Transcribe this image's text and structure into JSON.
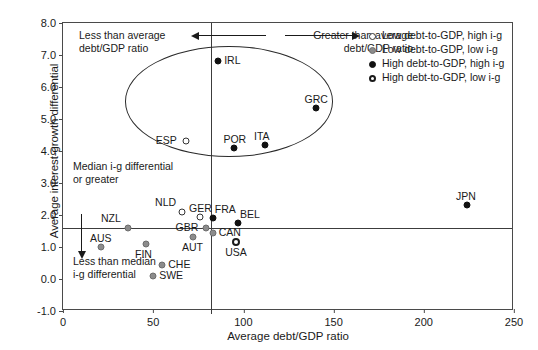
{
  "chart_data": {
    "type": "scatter",
    "title": "",
    "xlabel": "Average debt/GDP ratio",
    "ylabel": "Average interest-growth differential",
    "xlim": [
      0,
      250
    ],
    "ylim": [
      -1.0,
      8.0
    ],
    "xticks": [
      0,
      50,
      100,
      150,
      200,
      250
    ],
    "yticks": [
      -1.0,
      0.0,
      1.0,
      2.0,
      3.0,
      4.0,
      5.0,
      6.0,
      7.0,
      8.0
    ],
    "xtick_labels": [
      "0",
      "50",
      "100",
      "150",
      "200",
      "250"
    ],
    "ytick_labels": [
      "-1.0",
      "0.0",
      "1.0",
      "2.0",
      "3.0",
      "4.0",
      "5.0",
      "6.0",
      "7.0",
      "8.0"
    ],
    "grid": false,
    "legend_position": "top-right",
    "reference_lines": {
      "vertical_x": 82,
      "horizontal_y": 1.6
    },
    "ellipse": {
      "center_x": 92,
      "center_y": 5.55,
      "width_x": 115,
      "height_y": 3.45
    },
    "series": [
      {
        "name": "Low debt-to-GDP, high i-g",
        "marker": "open-circle",
        "color": "#ffffff",
        "edge_color": "#333333",
        "points": [
          {
            "label": "ESP",
            "x": 68,
            "y": 4.3,
            "label_pos": "left"
          },
          {
            "label": "NLD",
            "x": 66,
            "y": 2.1,
            "label_pos": "above-left"
          },
          {
            "label": "GER",
            "x": 76,
            "y": 1.95,
            "label_pos": "above"
          }
        ]
      },
      {
        "name": "Low debt-to-GDP, low i-g",
        "marker": "filled-gray-circle",
        "color": "#8c8c8c",
        "edge_color": "#6d6d6d",
        "points": [
          {
            "label": "NZL",
            "x": 36,
            "y": 1.6,
            "label_pos": "above-left"
          },
          {
            "label": "AUS",
            "x": 21,
            "y": 1.0,
            "label_pos": "above"
          },
          {
            "label": "FIN",
            "x": 46,
            "y": 1.1,
            "label_pos": "below"
          },
          {
            "label": "CHE",
            "x": 55,
            "y": 0.45,
            "label_pos": "right"
          },
          {
            "label": "SWE",
            "x": 50,
            "y": 0.1,
            "label_pos": "right"
          },
          {
            "label": "GBR",
            "x": 79,
            "y": 1.6,
            "label_pos": "left"
          },
          {
            "label": "AUT",
            "x": 72,
            "y": 1.3,
            "label_pos": "below"
          },
          {
            "label": "CAN",
            "x": 83,
            "y": 1.45,
            "label_pos": "right"
          }
        ]
      },
      {
        "name": "High debt-to-GDP, high i-g",
        "marker": "filled-black-circle",
        "color": "#111111",
        "edge_color": "#111111",
        "points": [
          {
            "label": "IRL",
            "x": 86,
            "y": 6.8,
            "label_pos": "right"
          },
          {
            "label": "GRC",
            "x": 140,
            "y": 5.35,
            "label_pos": "above"
          },
          {
            "label": "POR",
            "x": 95,
            "y": 4.1,
            "label_pos": "above"
          },
          {
            "label": "ITA",
            "x": 112,
            "y": 4.2,
            "label_pos": "above"
          },
          {
            "label": "FRA",
            "x": 83,
            "y": 1.9,
            "label_pos": "above-right"
          },
          {
            "label": "BEL",
            "x": 97,
            "y": 1.75,
            "label_pos": "above-right"
          },
          {
            "label": "JPN",
            "x": 224,
            "y": 2.3,
            "label_pos": "above"
          }
        ]
      },
      {
        "name": "High debt-to-GDP, low i-g",
        "marker": "thick-open-circle",
        "color": "#ffffff",
        "edge_color": "#1a1a1a",
        "points": [
          {
            "label": "USA",
            "x": 96,
            "y": 1.15,
            "label_pos": "below"
          }
        ]
      }
    ],
    "annotations": [
      {
        "id": "less-than-average",
        "text_line1": "Less than average",
        "text_line2": "debt/GDP ratio",
        "arrow": "left"
      },
      {
        "id": "greater-than-average",
        "text_line1": "Greater than average",
        "text_line2": "debt/GDP ratio",
        "arrow": "right"
      },
      {
        "id": "median-or-greater",
        "text_line1": "Median i-g differential",
        "text_line2": "or greater",
        "arrow": "none"
      },
      {
        "id": "less-than-median",
        "text_line1": "Less than median",
        "text_line2": "i-g differential",
        "arrow": "down"
      }
    ]
  },
  "legend": {
    "items": [
      {
        "label": "Low debt-to-GDP, high i-g",
        "marker_class": "m-lo-hi"
      },
      {
        "label": "Low debt-to-GDP, low i-g",
        "marker_class": "m-lo-lo"
      },
      {
        "label": "High debt-to-GDP, high i-g",
        "marker_class": "m-hi-hi"
      },
      {
        "label": "High debt-to-GDP, low i-g",
        "marker_class": "m-hi-lo"
      }
    ]
  }
}
